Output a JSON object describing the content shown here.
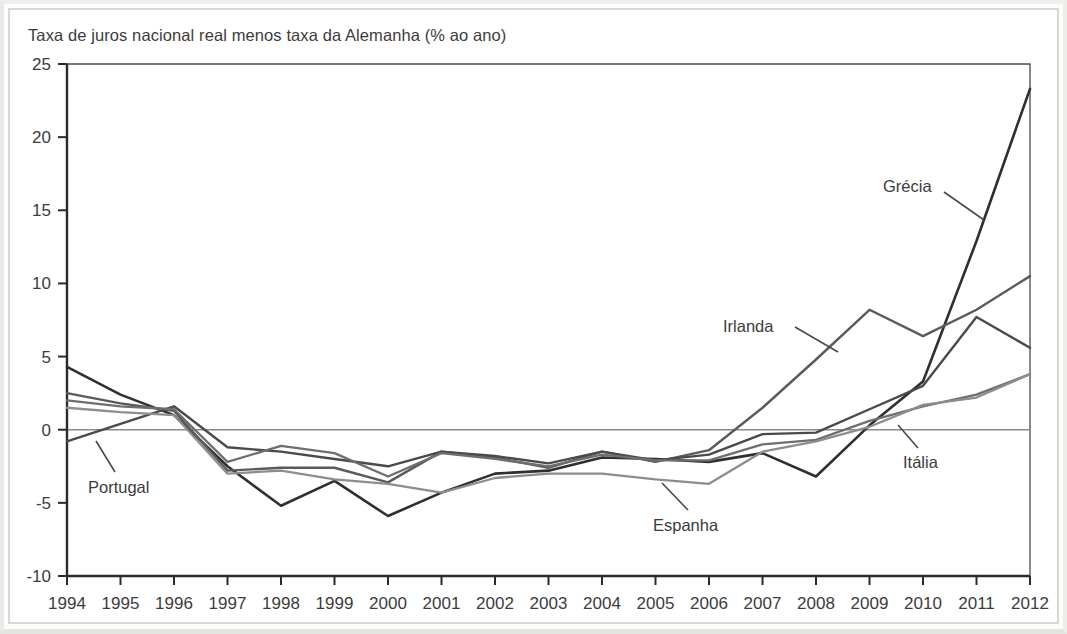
{
  "figure": {
    "title": "Taxa de juros nacional real menos taxa da Alemanha (% ao ano)"
  },
  "chart_data": {
    "type": "line",
    "title": "Taxa de juros nacional real menos taxa da Alemanha (% ao ano)",
    "xlabel": "",
    "ylabel": "",
    "xlim": [
      1994,
      2012
    ],
    "ylim": [
      -10,
      25
    ],
    "yticks": [
      -10,
      -5,
      0,
      5,
      10,
      15,
      20,
      25
    ],
    "ytick_labels": [
      "-10",
      "-5",
      "0",
      "5",
      "10",
      "15",
      "20",
      "25"
    ],
    "grid": false,
    "zero_line": true,
    "legend": "inline-annotations",
    "x": [
      1994,
      1995,
      1996,
      1997,
      1998,
      1999,
      2000,
      2001,
      2002,
      2003,
      2004,
      2005,
      2006,
      2007,
      2008,
      2009,
      2010,
      2011,
      2012
    ],
    "xtick_labels": [
      "1994",
      "1995",
      "1996",
      "1997",
      "1998",
      "1999",
      "2000",
      "2001",
      "2002",
      "2003",
      "2004",
      "2005",
      "2006",
      "2007",
      "2008",
      "2009",
      "2010",
      "2011",
      "2012"
    ],
    "series": [
      {
        "name": "Grécia",
        "color": "#2f2f2f",
        "width": 2.6,
        "values": [
          4.3,
          2.4,
          1.0,
          -2.5,
          -5.2,
          -3.5,
          -5.9,
          -4.3,
          -3.0,
          -2.8,
          -1.9,
          -2.0,
          -2.2,
          -1.6,
          -3.2,
          0.3,
          3.3,
          12.9,
          23.3
        ]
      },
      {
        "name": "Irlanda",
        "color": "#5a5a5a",
        "width": 2.4,
        "values": [
          2.5,
          1.8,
          1.3,
          -2.8,
          -2.6,
          -2.6,
          -3.6,
          -1.5,
          -1.9,
          -2.6,
          -1.5,
          -2.2,
          -1.4,
          1.5,
          4.8,
          8.2,
          6.4,
          8.2,
          10.5
        ]
      },
      {
        "name": "Portugal",
        "color": "#4a4a4a",
        "width": 2.4,
        "values": [
          -0.8,
          0.4,
          1.6,
          -1.2,
          -1.5,
          -2.0,
          -2.5,
          -1.5,
          -1.8,
          -2.3,
          -1.5,
          -2.1,
          -1.7,
          -0.3,
          -0.2,
          1.4,
          3.0,
          7.7,
          5.6
        ]
      },
      {
        "name": "Itália",
        "color": "#6e6e6e",
        "width": 2.3,
        "values": [
          2.0,
          1.6,
          1.4,
          -2.2,
          -1.1,
          -1.6,
          -3.2,
          -1.6,
          -2.0,
          -2.5,
          -1.7,
          -2.1,
          -2.1,
          -1.0,
          -0.7,
          0.6,
          1.6,
          2.4,
          3.8
        ]
      },
      {
        "name": "Espanha",
        "color": "#8d8d8d",
        "width": 2.3,
        "values": [
          1.5,
          1.2,
          1.0,
          -3.0,
          -2.8,
          -3.4,
          -3.7,
          -4.3,
          -3.3,
          -3.0,
          -3.0,
          -3.4,
          -3.7,
          -1.5,
          -0.8,
          0.2,
          1.7,
          2.2,
          3.8
        ]
      }
    ],
    "annotations": [
      {
        "label": "Portugal",
        "text_x": 88,
        "text_y": 493,
        "leader": {
          "x1": 115,
          "y1": 472,
          "x2": 96,
          "y2": 441
        }
      },
      {
        "label": "Espanha",
        "text_x": 653,
        "text_y": 531,
        "leader": {
          "x1": 688,
          "y1": 510,
          "x2": 662,
          "y2": 483
        }
      },
      {
        "label": "Irlanda",
        "text_x": 723,
        "text_y": 332,
        "leader": {
          "x1": 795,
          "y1": 327,
          "x2": 838,
          "y2": 352
        }
      },
      {
        "label": "Grécia",
        "text_x": 883,
        "text_y": 192,
        "leader": {
          "x1": 944,
          "y1": 192,
          "x2": 984,
          "y2": 220
        }
      },
      {
        "label": "Itália",
        "text_x": 903,
        "text_y": 468,
        "leader": {
          "x1": 918,
          "y1": 448,
          "x2": 898,
          "y2": 425
        }
      }
    ]
  }
}
